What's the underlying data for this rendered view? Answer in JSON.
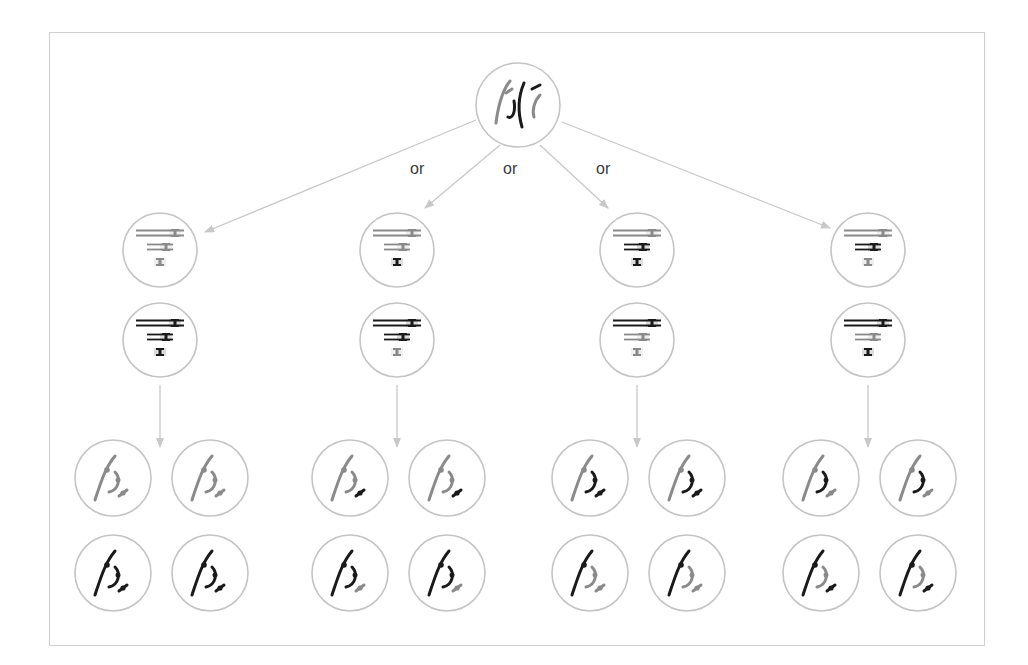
{
  "figure": {
    "colors": {
      "frame": "#cfcfcf",
      "cell_outline": "#c4c4c4",
      "arrow": "#c8c8c8",
      "maternal": "#1a1a1a",
      "paternal": "#8a8a8a",
      "label": "#3a3a3a"
    }
  },
  "labels": {
    "or": [
      "or",
      "or",
      "or"
    ]
  },
  "parent_cell": {
    "name": "parent-cell",
    "center": [
      518,
      105
    ],
    "radius": 42
  },
  "arrangements": [
    {
      "name": "arrangement-1",
      "x": 160,
      "upper_cell": [
        "paternal",
        "paternal",
        "paternal"
      ],
      "lower_cell": [
        "maternal",
        "maternal",
        "maternal"
      ],
      "daughters": [
        {
          "long": "paternal",
          "mid": "paternal",
          "short": "paternal"
        },
        {
          "long": "paternal",
          "mid": "paternal",
          "short": "paternal"
        },
        {
          "long": "maternal",
          "mid": "maternal",
          "short": "maternal"
        },
        {
          "long": "maternal",
          "mid": "maternal",
          "short": "maternal"
        }
      ]
    },
    {
      "name": "arrangement-2",
      "x": 397,
      "upper_cell": [
        "paternal",
        "paternal",
        "maternal"
      ],
      "lower_cell": [
        "maternal",
        "maternal",
        "paternal"
      ],
      "daughters": [
        {
          "long": "paternal",
          "mid": "paternal",
          "short": "maternal"
        },
        {
          "long": "paternal",
          "mid": "paternal",
          "short": "maternal"
        },
        {
          "long": "maternal",
          "mid": "maternal",
          "short": "paternal"
        },
        {
          "long": "maternal",
          "mid": "maternal",
          "short": "paternal"
        }
      ]
    },
    {
      "name": "arrangement-3",
      "x": 637,
      "upper_cell": [
        "paternal",
        "maternal",
        "maternal"
      ],
      "lower_cell": [
        "maternal",
        "paternal",
        "paternal"
      ],
      "daughters": [
        {
          "long": "paternal",
          "mid": "maternal",
          "short": "maternal"
        },
        {
          "long": "paternal",
          "mid": "maternal",
          "short": "maternal"
        },
        {
          "long": "maternal",
          "mid": "paternal",
          "short": "paternal"
        },
        {
          "long": "maternal",
          "mid": "paternal",
          "short": "paternal"
        }
      ]
    },
    {
      "name": "arrangement-4",
      "x": 868,
      "upper_cell": [
        "paternal",
        "maternal",
        "paternal"
      ],
      "lower_cell": [
        "maternal",
        "paternal",
        "maternal"
      ],
      "daughters": [
        {
          "long": "paternal",
          "mid": "maternal",
          "short": "paternal"
        },
        {
          "long": "paternal",
          "mid": "maternal",
          "short": "paternal"
        },
        {
          "long": "maternal",
          "mid": "paternal",
          "short": "maternal"
        },
        {
          "long": "maternal",
          "mid": "paternal",
          "short": "maternal"
        }
      ]
    }
  ]
}
